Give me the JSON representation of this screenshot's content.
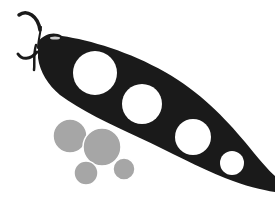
{
  "illustration": {
    "subject": "pea-pod",
    "colors": {
      "background": "#ffffff",
      "pod": "#1a1a1a",
      "pod_holes": "#ffffff",
      "peas": "#a6a6a6"
    },
    "pod_hole_count": 4,
    "loose_pea_count": 4
  }
}
